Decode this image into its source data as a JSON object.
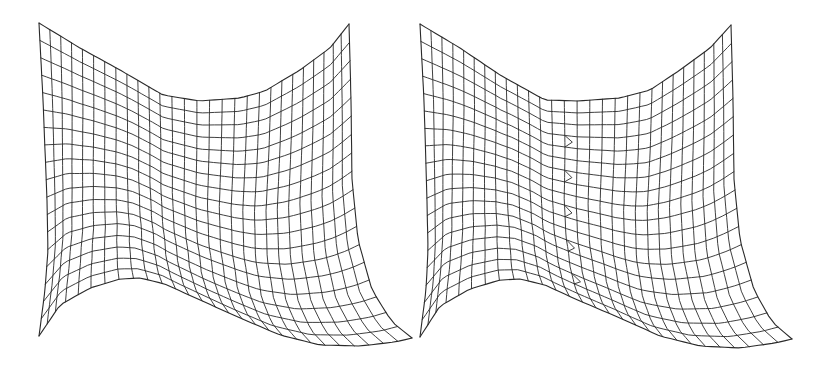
{
  "figure": {
    "width": 828,
    "height": 368,
    "background": "#ffffff",
    "line_color": "#2a2a2a",
    "panels": [
      {
        "name": "mesh-left",
        "offset_x": 0,
        "cols": 28,
        "rows": 18,
        "top_left": [
          39,
          23
        ],
        "top_right": [
          349,
          24
        ],
        "bottom_left": [
          39,
          336
        ],
        "bottom_right": [
          412,
          338
        ],
        "top_curve": [
          [
            39,
            23
          ],
          [
            80,
            48
          ],
          [
            120,
            70
          ],
          [
            163,
            95
          ],
          [
            200,
            101
          ],
          [
            240,
            98
          ],
          [
            265,
            91
          ],
          [
            300,
            70
          ],
          [
            330,
            48
          ],
          [
            349,
            24
          ]
        ],
        "bottom_curve": [
          [
            39,
            336
          ],
          [
            60,
            305
          ],
          [
            90,
            288
          ],
          [
            120,
            279
          ],
          [
            140,
            278
          ],
          [
            165,
            284
          ],
          [
            200,
            300
          ],
          [
            240,
            318
          ],
          [
            280,
            335
          ],
          [
            320,
            345
          ],
          [
            360,
            346
          ],
          [
            395,
            342
          ],
          [
            412,
            338
          ]
        ],
        "left_curve": [
          [
            39,
            23
          ],
          [
            43,
            100
          ],
          [
            47,
            200
          ],
          [
            48,
            250
          ],
          [
            45,
            290
          ],
          [
            39,
            336
          ]
        ],
        "right_curve": [
          [
            349,
            24
          ],
          [
            351,
            100
          ],
          [
            352,
            180
          ],
          [
            358,
            240
          ],
          [
            372,
            290
          ],
          [
            392,
            322
          ],
          [
            412,
            338
          ]
        ],
        "seam": null
      },
      {
        "name": "mesh-right",
        "offset_x": 381,
        "cols": 28,
        "rows": 18,
        "top_left": [
          420,
          24
        ],
        "top_right": [
          731,
          25
        ],
        "bottom_left": [
          420,
          337
        ],
        "bottom_right": [
          792,
          339
        ],
        "top_curve": [
          [
            420,
            24
          ],
          [
            460,
            48
          ],
          [
            500,
            75
          ],
          [
            545,
            100
          ],
          [
            578,
            101
          ],
          [
            620,
            98
          ],
          [
            650,
            90
          ],
          [
            680,
            70
          ],
          [
            710,
            48
          ],
          [
            731,
            25
          ]
        ],
        "bottom_curve": [
          [
            420,
            337
          ],
          [
            440,
            306
          ],
          [
            470,
            289
          ],
          [
            500,
            280
          ],
          [
            520,
            279
          ],
          [
            545,
            285
          ],
          [
            580,
            301
          ],
          [
            620,
            318
          ],
          [
            660,
            336
          ],
          [
            700,
            346
          ],
          [
            740,
            348
          ],
          [
            775,
            343
          ],
          [
            792,
            339
          ]
        ],
        "left_curve": [
          [
            420,
            24
          ],
          [
            424,
            100
          ],
          [
            427,
            200
          ],
          [
            428,
            250
          ],
          [
            426,
            290
          ],
          [
            420,
            337
          ]
        ],
        "right_curve": [
          [
            731,
            25
          ],
          [
            733,
            100
          ],
          [
            734,
            180
          ],
          [
            740,
            240
          ],
          [
            754,
            290
          ],
          [
            772,
            322
          ],
          [
            792,
            339
          ]
        ],
        "seam": {
          "x_col": 13
        }
      }
    ]
  }
}
